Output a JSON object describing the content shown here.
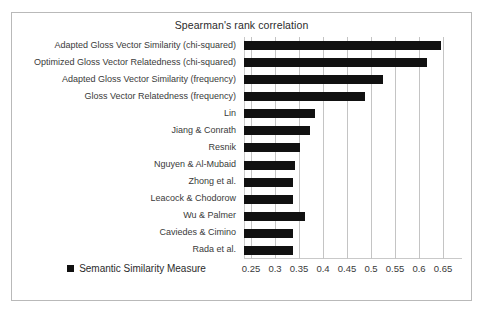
{
  "chart_data": {
    "type": "bar",
    "orientation": "horizontal",
    "title": "Spearman's rank correlation",
    "xlabel": "",
    "ylabel": "",
    "xlim": [
      0.25,
      0.65
    ],
    "xticks": [
      0.25,
      0.3,
      0.35,
      0.4,
      0.45,
      0.5,
      0.55,
      0.6,
      0.65
    ],
    "xtick_labels": [
      "0.25",
      "0.3",
      "0.35",
      "0.4",
      "0.45",
      "0.5",
      "0.55",
      "0.6",
      "0.65"
    ],
    "grid": true,
    "grid_axis": "x",
    "legend": [
      {
        "name": "Semantic Similarity Measure",
        "color": "#111111",
        "marker": "square"
      }
    ],
    "legend_position": "bottom-left",
    "bar_color": "#111111",
    "categories": [
      "Adapted Gloss Vector Similarity (chi-squared)",
      "Optimized Gloss Vector Relatedness (chi-squared)",
      "Adapted Gloss Vector Similarity (frequency)",
      "Gloss Vector Relatedness (frequency)",
      "Lin",
      "Jiang & Conrath",
      "Resnik",
      "Nguyen & Al-Mubaid",
      "Zhong et al.",
      "Leacock & Chodorow",
      "Wu & Palmer",
      "Caviedes & Cimino",
      "Rada et al."
    ],
    "values": [
      0.645,
      0.617,
      0.525,
      0.487,
      0.383,
      0.372,
      0.352,
      0.342,
      0.338,
      0.338,
      0.362,
      0.337,
      0.337
    ],
    "series": [
      {
        "name": "Semantic Similarity Measure",
        "values": [
          0.645,
          0.617,
          0.525,
          0.487,
          0.383,
          0.372,
          0.352,
          0.342,
          0.338,
          0.338,
          0.362,
          0.337,
          0.337
        ]
      }
    ]
  }
}
